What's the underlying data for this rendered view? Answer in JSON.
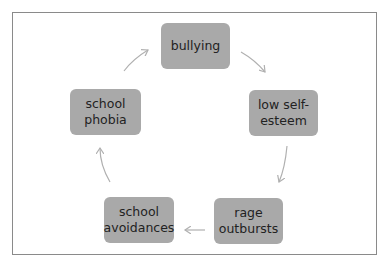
{
  "diagram": {
    "type": "cycle",
    "colors": {
      "node_fill": "#a9a9a9",
      "arrow": "#b0b0b0",
      "frame": "#8a8a8a",
      "text": "#222222"
    },
    "nodes": [
      {
        "id": "bullying",
        "label": "bullying"
      },
      {
        "id": "low-self-esteem",
        "label": "low self-\nesteem"
      },
      {
        "id": "rage-outbursts",
        "label": "rage\noutbursts"
      },
      {
        "id": "school-avoidances",
        "label": "school\navoidances"
      },
      {
        "id": "school-phobia",
        "label": "school\nphobia"
      }
    ],
    "edges": [
      {
        "from": "bullying",
        "to": "low-self-esteem"
      },
      {
        "from": "low-self-esteem",
        "to": "rage-outbursts"
      },
      {
        "from": "rage-outbursts",
        "to": "school-avoidances"
      },
      {
        "from": "school-avoidances",
        "to": "school-phobia"
      },
      {
        "from": "school-phobia",
        "to": "bullying"
      }
    ]
  }
}
